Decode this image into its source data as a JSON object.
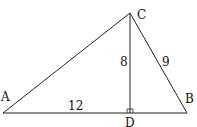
{
  "diagram": {
    "points": {
      "A": {
        "label": "A",
        "x": 3,
        "y": 113
      },
      "B": {
        "label": "B",
        "x": 187,
        "y": 113
      },
      "C": {
        "label": "C",
        "x": 130,
        "y": 13
      },
      "D": {
        "label": "D",
        "x": 130,
        "y": 113
      }
    },
    "segment_labels": {
      "CD": "8",
      "CB": "9",
      "AD": "12"
    },
    "right_angle_at": "D",
    "line_color": "#222222"
  }
}
